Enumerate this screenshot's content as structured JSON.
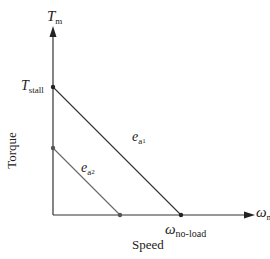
{
  "diagram": {
    "y_axis": {
      "symbol": "T",
      "subscript": "m",
      "title": "Torque"
    },
    "x_axis": {
      "symbol": "ω",
      "subscript": "m",
      "title": "Speed"
    },
    "points": {
      "stall": {
        "symbol": "T",
        "subscript": "stall"
      },
      "no_load": {
        "symbol": "ω",
        "subscript": "no-load"
      }
    },
    "lines": [
      {
        "symbol": "e",
        "subscript": "a",
        "subsubscript": "1"
      },
      {
        "symbol": "e",
        "subscript": "a",
        "subsubscript": "2"
      }
    ],
    "colors": {
      "line": "#333333",
      "line_light": "#555555",
      "point": "#222222"
    }
  }
}
